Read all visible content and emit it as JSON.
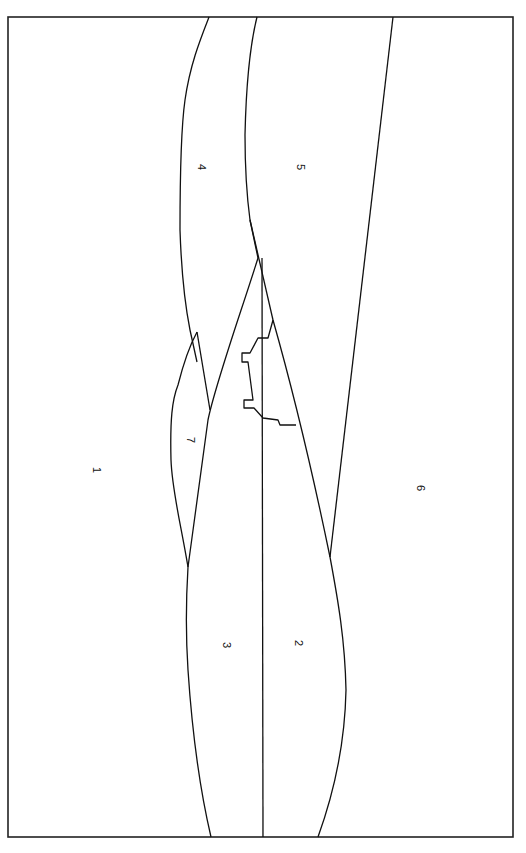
{
  "diagram": {
    "frame": {
      "x": 8,
      "y": 17,
      "width": 505,
      "height": 820
    },
    "stroke_color": "#111111",
    "background": "#ffffff",
    "regions": [
      {
        "id": "1",
        "label": "1",
        "x": 97,
        "y": 470
      },
      {
        "id": "2",
        "label": "2",
        "x": 299,
        "y": 643
      },
      {
        "id": "3",
        "label": "3",
        "x": 227,
        "y": 645
      },
      {
        "id": "4",
        "label": "4",
        "x": 202,
        "y": 167
      },
      {
        "id": "5",
        "label": "5",
        "x": 301,
        "y": 167
      },
      {
        "id": "6",
        "label": "6",
        "x": 421,
        "y": 488
      },
      {
        "id": "7",
        "label": "7",
        "x": 191,
        "y": 440
      }
    ],
    "lines": {
      "boundary_1_4": "M209,17 C200,40 190,65 185,100 C180,135 180,190 180,230 C181,260 184,300 190,330 L197,362",
      "boundary_4_5": "M257,17 C250,45 246,90 245,135 C245,170 246,190 250,220 L258,258",
      "boundary_5_6": "M393,17 L330,557",
      "line_4_3": "M258,258 C240,315 215,385 208,420 L188,567",
      "line_4_2": "M250,220 L273,320",
      "line_center_vertical": "M262,258 L263,837",
      "region_7_outer": "M197,332 C190,345 183,365 178,385 C172,400 170,420 171,460 C172,490 180,520 188,567",
      "region_7_inner": "M197,332 L210,410",
      "notched_block": "M273,320 L268,338 L258,338 L250,353 L242,353 L242,362 L248,362 L253,400 L244,400 L244,408 L254,408 L263,418 L278,420 L280,425 L296,425",
      "line_2_6": "M273,320 C290,380 310,460 330,557 C338,600 345,640 346,690 C345,740 335,790 318,837",
      "line_3_1": "M188,567 C186,600 186,640 188,670 C192,730 200,790 211,837"
    }
  }
}
